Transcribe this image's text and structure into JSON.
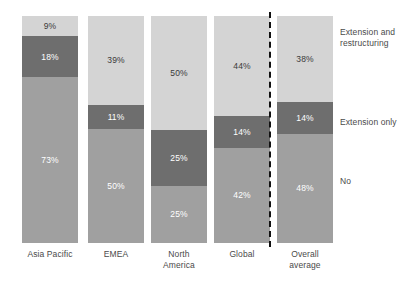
{
  "chart_data": {
    "type": "bar",
    "subtype": "stacked-100-percent",
    "title": "",
    "subtitle": "",
    "xlabel": "",
    "ylabel": "",
    "ylim": [
      0,
      100
    ],
    "grid": false,
    "legend_position": "right",
    "stack_order": "top-to-bottom",
    "value_suffix": "%",
    "categories": [
      "Asia Pacific",
      "EMEA",
      "North America",
      "Global",
      "Overall average"
    ],
    "series": [
      {
        "name": "Extension and restructuring",
        "color": "#d4d4d4",
        "values": [
          9,
          39,
          50,
          44,
          38
        ]
      },
      {
        "name": "Extension only",
        "color": "#6e6e6e",
        "values": [
          18,
          11,
          25,
          14,
          14
        ]
      },
      {
        "name": "No",
        "color": "#a0a0a0",
        "values": [
          73,
          50,
          25,
          42,
          48
        ]
      }
    ],
    "annotations": {
      "divider": {
        "style": "dashed-vertical",
        "color": "#111111",
        "after_category": "Global"
      }
    }
  },
  "bars": [
    {
      "category": "Asia Pacific",
      "label_lines": "Asia Pacific",
      "segments": [
        {
          "series": "Extension and restructuring",
          "value": 9,
          "label": "9%",
          "color": "#d4d4d4",
          "text_on": "light"
        },
        {
          "series": "Extension only",
          "value": 18,
          "label": "18%",
          "color": "#6e6e6e",
          "text_on": "dark"
        },
        {
          "series": "No",
          "value": 73,
          "label": "73%",
          "color": "#a0a0a0",
          "text_on": "dark"
        }
      ]
    },
    {
      "category": "EMEA",
      "label_lines": "EMEA",
      "segments": [
        {
          "series": "Extension and restructuring",
          "value": 39,
          "label": "39%",
          "color": "#d4d4d4",
          "text_on": "light"
        },
        {
          "series": "Extension only",
          "value": 11,
          "label": "11%",
          "color": "#6e6e6e",
          "text_on": "dark"
        },
        {
          "series": "No",
          "value": 50,
          "label": "50%",
          "color": "#a0a0a0",
          "text_on": "dark"
        }
      ]
    },
    {
      "category": "North America",
      "label_lines": "North\nAmerica",
      "segments": [
        {
          "series": "Extension and restructuring",
          "value": 50,
          "label": "50%",
          "color": "#d4d4d4",
          "text_on": "light"
        },
        {
          "series": "Extension only",
          "value": 25,
          "label": "25%",
          "color": "#6e6e6e",
          "text_on": "dark"
        },
        {
          "series": "No",
          "value": 25,
          "label": "25%",
          "color": "#a0a0a0",
          "text_on": "dark"
        }
      ]
    },
    {
      "category": "Global",
      "label_lines": "Global",
      "segments": [
        {
          "series": "Extension and restructuring",
          "value": 44,
          "label": "44%",
          "color": "#d4d4d4",
          "text_on": "light"
        },
        {
          "series": "Extension only",
          "value": 14,
          "label": "14%",
          "color": "#6e6e6e",
          "text_on": "dark"
        },
        {
          "series": "No",
          "value": 42,
          "label": "42%",
          "color": "#a0a0a0",
          "text_on": "dark"
        }
      ]
    },
    {
      "category": "Overall average",
      "label_lines": "Overall\naverage",
      "segments": [
        {
          "series": "Extension and restructuring",
          "value": 38,
          "label": "38%",
          "color": "#d4d4d4",
          "text_on": "light"
        },
        {
          "series": "Extension only",
          "value": 14,
          "label": "14%",
          "color": "#6e6e6e",
          "text_on": "dark"
        },
        {
          "series": "No",
          "value": 48,
          "label": "48%",
          "color": "#a0a0a0",
          "text_on": "dark"
        }
      ]
    }
  ],
  "legend": [
    {
      "label": "Extension and\nrestructuring",
      "color": "#d4d4d4"
    },
    {
      "label": "Extension only",
      "color": "#6e6e6e"
    },
    {
      "label": "No",
      "color": "#a0a0a0"
    }
  ]
}
